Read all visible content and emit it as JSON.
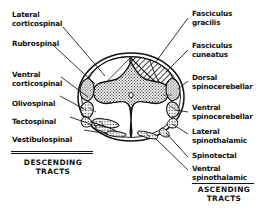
{
  "descending": {
    "group_label_line1": "DESCENDING",
    "group_label_line2": "TRACTS",
    "labels": [
      {
        "id": "lateral-corticospinal",
        "line1": "Lateral",
        "line2": "corticospinal"
      },
      {
        "id": "rubrospinal",
        "line1": "Rubrospinal",
        "line2": ""
      },
      {
        "id": "ventral-corticospinal",
        "line1": "Ventral",
        "line2": "corticospinal"
      },
      {
        "id": "olivospinal",
        "line1": "Olivospinal",
        "line2": ""
      },
      {
        "id": "tectospinal",
        "line1": "Tectospinal",
        "line2": ""
      },
      {
        "id": "vestibulospinal",
        "line1": "Vestibulospinal",
        "line2": ""
      }
    ]
  },
  "ascending": {
    "group_label_line1": "ASCENDING",
    "group_label_line2": "TRACTS",
    "labels": [
      {
        "id": "fasciculus-gracilis",
        "line1": "Fasciculus",
        "line2": "gracilis"
      },
      {
        "id": "fasciculus-cuneatus",
        "line1": "Fasciculus",
        "line2": "cuneatus"
      },
      {
        "id": "dorsal-spinocerebellar",
        "line1": "Dorsal",
        "line2": "spinocerebellar"
      },
      {
        "id": "ventral-spinocerebellar",
        "line1": "Ventral",
        "line2": "spinocerebellar"
      },
      {
        "id": "lateral-spinothalamic",
        "line1": "Lateral",
        "line2": "spinothalamic"
      },
      {
        "id": "spinotectal",
        "line1": "Spinotectal",
        "line2": ""
      },
      {
        "id": "ventral-spinothalamic",
        "line1": "Ventral",
        "line2": "spinothalamic"
      }
    ]
  },
  "colors": {
    "ink": "#111111",
    "background": "#ffffff",
    "gray_matter_fill": "#b9b9b9",
    "tract_fill": "#d8d8d8",
    "white_matter_fill": "#ffffff"
  }
}
